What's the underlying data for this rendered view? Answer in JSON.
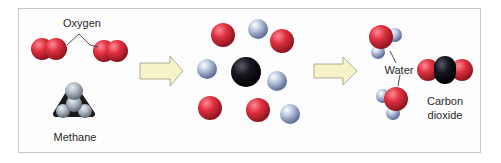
{
  "diagram": {
    "colors": {
      "oxygen": "#d8283a",
      "hydrogen": "#a9b6d4",
      "carbon": "#151515",
      "arrow_fill": "#f6f3c8",
      "arrow_stroke": "#9a9a80",
      "frame": "#c8c8c8"
    },
    "stages": [
      {
        "name": "reactants",
        "labels": {
          "oxygen": "Oxygen",
          "methane": "Methane"
        }
      },
      {
        "name": "separated-atoms",
        "atoms": {
          "carbon": 1,
          "oxygen": 4,
          "hydrogen": 4
        }
      },
      {
        "name": "products",
        "labels": {
          "water": "Water",
          "carbon_dioxide_line1": "Carbon",
          "carbon_dioxide_line2": "dioxide"
        }
      }
    ],
    "arrows": 2
  }
}
